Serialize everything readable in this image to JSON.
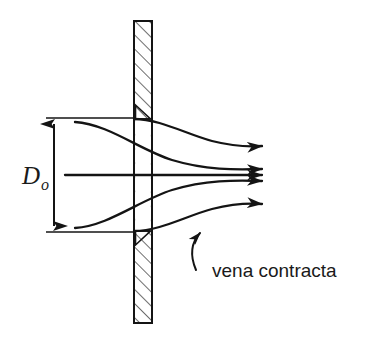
{
  "figure": {
    "background_color": "#ffffff",
    "line_color": "#1a1a1a",
    "hatch_color": "#555555",
    "width": 367,
    "height": 344
  },
  "labels": {
    "diameter_symbol": "D",
    "diameter_subscript": "o",
    "annotation": "vena contracta"
  },
  "plate": {
    "name": "orifice-plate",
    "x": 134,
    "y": 21,
    "width": 18,
    "height": 302,
    "hatch_angle_deg": 45,
    "hatch_spacing": 7
  },
  "orifice": {
    "top_y": 118,
    "bottom_y": 232,
    "opening_height": 114
  },
  "dimension": {
    "name": "orifice-diameter-dimension",
    "line_x": 54,
    "top_y": 118,
    "bottom_y": 232,
    "extension_left_x": 46,
    "extension_right_x": 133,
    "label_x": 22,
    "label_y": 183
  },
  "streamlines": [
    {
      "name": "streamline-upper-outer",
      "path": "M 75 122 C 108 124 140 150 172 160 C 205 170 235 170 266 169",
      "arrow_at": {
        "x": 266,
        "y": 169,
        "angle_deg": -2
      }
    },
    {
      "name": "streamline-upper-inner",
      "path": "M 134 119 C 160 119 186 134 212 141 C 232 146 250 147 266 146",
      "arrow_at": {
        "x": 266,
        "y": 146,
        "angle_deg": -2
      }
    },
    {
      "name": "streamline-center",
      "path": "M 65 175 L 266 175",
      "arrow_at": {
        "x": 266,
        "y": 175,
        "angle_deg": 0
      }
    },
    {
      "name": "streamline-lower-inner",
      "path": "M 134 231 C 160 231 186 216 212 209 C 232 204 250 203 266 204",
      "arrow_at": {
        "x": 266,
        "y": 204,
        "angle_deg": 2
      }
    },
    {
      "name": "streamline-lower-outer",
      "path": "M 75 228 C 108 226 140 200 172 190 C 205 180 235 180 266 181",
      "arrow_at": {
        "x": 266,
        "y": 181,
        "angle_deg": 2
      }
    }
  ],
  "annotation_leader": {
    "name": "vena-contracta-leader",
    "path": "M 196 268 C 192 256 192 243 200 232",
    "arrow_at": {
      "x": 201,
      "y": 230,
      "angle_deg": -62
    },
    "text_x": 212,
    "text_y": 276
  }
}
